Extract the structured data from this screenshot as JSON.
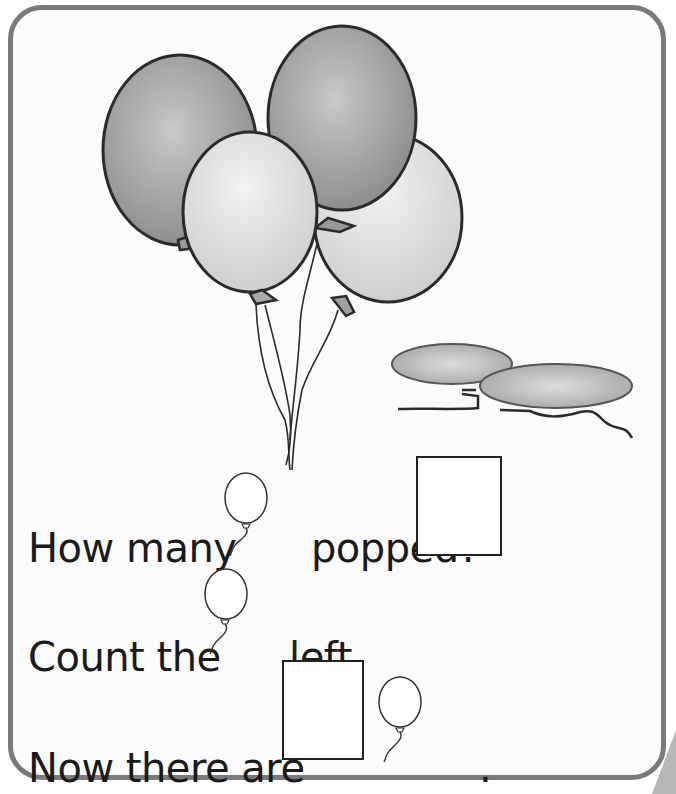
{
  "worksheet": {
    "illustration": {
      "floating_balloons": 4,
      "popped_balloons": 2,
      "colors": {
        "dark_balloon": "#9a9a9a",
        "light_balloon": "#d9d9d9",
        "outline": "#2a2a2a",
        "popped": "#a8a8a8"
      }
    },
    "questions": [
      {
        "before": "How many",
        "icon": "balloon-icon",
        "after": "popped?",
        "answer": ""
      },
      {
        "before": "Count the",
        "icon": "balloon-icon",
        "after": "left.",
        "answer": null
      },
      {
        "before": "Now there are",
        "icon": "balloon-icon",
        "after": ".",
        "answer": ""
      }
    ]
  }
}
